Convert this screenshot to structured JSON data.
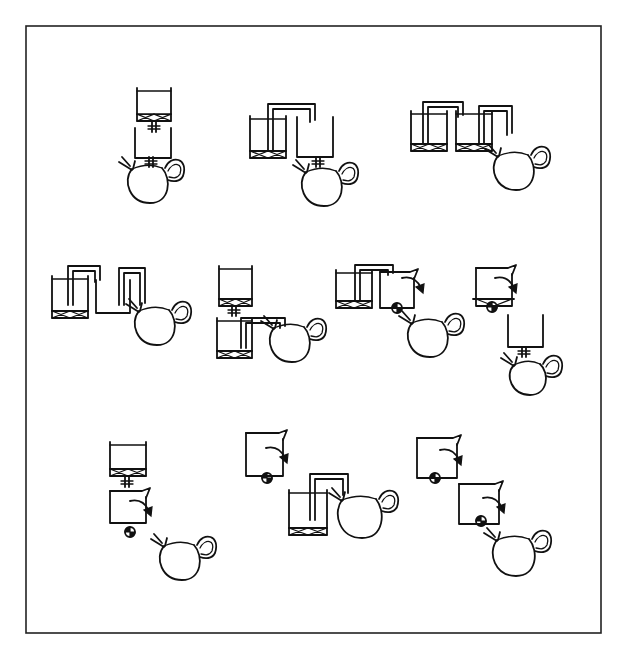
{
  "figure": {
    "frame": {
      "x": 26,
      "y": 26,
      "w": 575,
      "h": 607
    },
    "ink_color": "#111111",
    "background": "#ffffff"
  },
  "panels": [
    {
      "id": "panel-1",
      "description": "stacked filter cylinder over vessel over teapot, gate valves between",
      "items": [
        {
          "type": "filter_vessel",
          "x": 137,
          "y": 90,
          "w": 34,
          "h": 31
        },
        {
          "type": "gate_valve",
          "x": 154,
          "y": 127
        },
        {
          "type": "open_vessel",
          "x": 135,
          "y": 128,
          "w": 36,
          "h": 30
        },
        {
          "type": "gate_valve",
          "x": 151,
          "y": 162
        },
        {
          "type": "teapot",
          "cx": 148,
          "cy": 183,
          "r": 20
        }
      ]
    },
    {
      "id": "panel-2",
      "description": "filter vessel siphons into vessel with gate valve over teapot",
      "items": [
        {
          "type": "filter_vessel",
          "x": 250,
          "y": 118,
          "w": 36,
          "h": 40
        },
        {
          "type": "siphon",
          "x1": 273,
          "y1": 150,
          "x2": 315,
          "y2": 122,
          "top": 104
        },
        {
          "type": "open_vessel",
          "x": 297,
          "y": 117,
          "w": 36,
          "h": 40
        },
        {
          "type": "gate_valve",
          "x": 318,
          "y": 162
        },
        {
          "type": "teapot",
          "cx": 322,
          "cy": 186,
          "r": 20
        }
      ]
    },
    {
      "id": "panel-3",
      "description": "two filter vessels chained by siphons into teapot",
      "items": [
        {
          "type": "filter_vessel",
          "x": 411,
          "y": 113,
          "w": 36,
          "h": 38
        },
        {
          "type": "siphon",
          "x1": 428,
          "y1": 143,
          "x2": 463,
          "y2": 117,
          "top": 102
        },
        {
          "type": "filter_vessel",
          "x": 456,
          "y": 113,
          "w": 36,
          "h": 38
        },
        {
          "type": "siphon",
          "x1": 484,
          "y1": 143,
          "x2": 512,
          "y2": 135,
          "top": 106
        },
        {
          "type": "teapot",
          "cx": 514,
          "cy": 170,
          "r": 20
        }
      ]
    },
    {
      "id": "panel-4",
      "description": "filter vessel siphons to vessel, then siphon over to teapot",
      "items": [
        {
          "type": "filter_vessel",
          "x": 52,
          "y": 278,
          "w": 36,
          "h": 40
        },
        {
          "type": "siphon",
          "x1": 73,
          "y1": 305,
          "x2": 100,
          "y2": 282,
          "top": 266
        },
        {
          "type": "open_vessel",
          "x": 96,
          "y": 280,
          "w": 34,
          "h": 33
        },
        {
          "type": "siphon",
          "x1": 124,
          "y1": 305,
          "x2": 145,
          "y2": 305,
          "top": 268
        },
        {
          "type": "teapot",
          "cx": 155,
          "cy": 325,
          "r": 20
        }
      ]
    },
    {
      "id": "panel-5",
      "description": "filter vessel with gate valve over filter vessel siphoning into teapot",
      "items": [
        {
          "type": "filter_vessel",
          "x": 219,
          "y": 268,
          "w": 33,
          "h": 38
        },
        {
          "type": "gate_valve",
          "x": 234,
          "y": 311
        },
        {
          "type": "filter_vessel",
          "x": 217,
          "y": 320,
          "w": 35,
          "h": 38
        },
        {
          "type": "siphon",
          "x1": 246,
          "y1": 348,
          "x2": 285,
          "y2": 328,
          "top": 318
        },
        {
          "type": "teapot",
          "cx": 290,
          "cy": 342,
          "r": 20
        }
      ]
    },
    {
      "id": "panel-6",
      "description": "filter vessel siphons to vessel with ball valve and pour spout over teapot",
      "items": [
        {
          "type": "filter_vessel",
          "x": 336,
          "y": 272,
          "w": 36,
          "h": 36
        },
        {
          "type": "siphon",
          "x1": 360,
          "y1": 300,
          "x2": 393,
          "y2": 275,
          "top": 265
        },
        {
          "type": "pour_vessel",
          "x": 380,
          "y": 272,
          "w": 34,
          "h": 36
        },
        {
          "type": "ball_valve",
          "cx": 397,
          "cy": 308
        },
        {
          "type": "pour_arrow",
          "x": 412,
          "y": 277
        },
        {
          "type": "teapot",
          "cx": 428,
          "cy": 337,
          "r": 20
        }
      ]
    },
    {
      "id": "panel-7",
      "description": "pour vessel with filter and ball valve, separate vessel with gate valve over teapot",
      "items": [
        {
          "type": "pour_vessel_filter",
          "x": 476,
          "y": 268,
          "w": 36,
          "h": 38
        },
        {
          "type": "ball_valve",
          "cx": 492,
          "cy": 307
        },
        {
          "type": "pour_arrow",
          "x": 505,
          "y": 277
        },
        {
          "type": "open_vessel",
          "x": 508,
          "y": 315,
          "w": 35,
          "h": 32
        },
        {
          "type": "gate_valve",
          "x": 524,
          "y": 352
        },
        {
          "type": "teapot",
          "cx": 528,
          "cy": 377,
          "r": 18
        }
      ]
    },
    {
      "id": "panel-8",
      "description": "filter vessel with gate valve over pour vessel with ball valve, teapot",
      "items": [
        {
          "type": "filter_vessel",
          "x": 110,
          "y": 444,
          "w": 36,
          "h": 32
        },
        {
          "type": "gate_valve",
          "x": 127,
          "y": 482
        },
        {
          "type": "pour_vessel",
          "x": 110,
          "y": 491,
          "w": 36,
          "h": 32
        },
        {
          "type": "ball_valve",
          "cx": 130,
          "cy": 532
        },
        {
          "type": "pour_arrow",
          "x": 140,
          "y": 500
        },
        {
          "type": "teapot",
          "cx": 180,
          "cy": 560,
          "r": 20
        }
      ]
    },
    {
      "id": "panel-9",
      "description": "pour vessel with ball valve, filter vessel siphoning into teapot",
      "items": [
        {
          "type": "pour_vessel",
          "x": 246,
          "y": 433,
          "w": 37,
          "h": 43
        },
        {
          "type": "ball_valve",
          "cx": 267,
          "cy": 478
        },
        {
          "type": "pour_arrow",
          "x": 276,
          "y": 447
        },
        {
          "type": "filter_vessel",
          "x": 289,
          "y": 492,
          "w": 38,
          "h": 43
        },
        {
          "type": "siphon",
          "x1": 315,
          "y1": 520,
          "x2": 348,
          "y2": 495,
          "top": 474
        },
        {
          "type": "teapot",
          "cx": 360,
          "cy": 516,
          "r": 22
        }
      ]
    },
    {
      "id": "panel-10",
      "description": "two pour vessels with ball valves cascading into teapot",
      "items": [
        {
          "type": "pour_vessel",
          "x": 417,
          "y": 438,
          "w": 40,
          "h": 40
        },
        {
          "type": "ball_valve",
          "cx": 435,
          "cy": 478
        },
        {
          "type": "pour_arrow",
          "x": 450,
          "y": 449
        },
        {
          "type": "pour_vessel",
          "x": 459,
          "y": 484,
          "w": 40,
          "h": 40
        },
        {
          "type": "ball_valve",
          "cx": 481,
          "cy": 521
        },
        {
          "type": "pour_arrow",
          "x": 493,
          "y": 497
        },
        {
          "type": "teapot",
          "cx": 514,
          "cy": 555,
          "r": 21
        }
      ]
    }
  ]
}
